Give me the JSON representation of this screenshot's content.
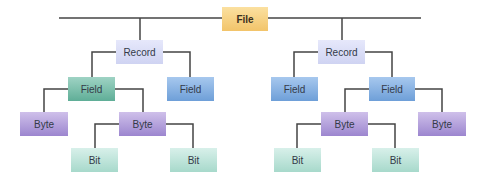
{
  "diagram": {
    "type": "hierarchy",
    "colors": {
      "file": "#f5cd7a",
      "record": "#d9dcf6",
      "field_teal": "#74bba6",
      "field_blue": "#83aee2",
      "byte": "#ac98d8",
      "bit": "#bfe3d9",
      "line": "#444444"
    },
    "nodes": {
      "file": "File",
      "left": {
        "record": "Record",
        "field_a": "Field",
        "field_b": "Field",
        "byte_a": "Byte",
        "byte_b": "Byte",
        "bit_a": "Bit",
        "bit_b": "Bit"
      },
      "right": {
        "record": "Record",
        "field_a": "Field",
        "field_b": "Field",
        "byte_a": "Byte",
        "byte_b": "Byte",
        "bit_a": "Bit",
        "bit_b": "Bit"
      }
    }
  }
}
